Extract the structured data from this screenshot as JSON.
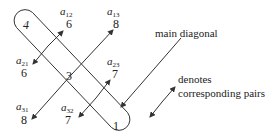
{
  "diagram": {
    "diagonal": [
      {
        "value": "4",
        "italic": true
      },
      {
        "value": "3",
        "italic": false
      },
      {
        "value": "1",
        "italic": false
      }
    ],
    "entries": {
      "a12": {
        "symbol": "a",
        "sub": "12",
        "value": "6"
      },
      "a13": {
        "symbol": "a",
        "sub": "13",
        "value": "8"
      },
      "a21": {
        "symbol": "a",
        "sub": "21",
        "value": "6"
      },
      "a23": {
        "symbol": "a",
        "sub": "23",
        "value": "7"
      },
      "a31": {
        "symbol": "a",
        "sub": "31",
        "value": "8"
      },
      "a32": {
        "symbol": "a",
        "sub": "32",
        "value": "7"
      }
    },
    "pairs": [
      [
        "a12",
        "a21"
      ],
      [
        "a13",
        "a31"
      ],
      [
        "a23",
        "a32"
      ]
    ],
    "annotations": {
      "main_diagonal": "main diagonal",
      "legend_line1": "denotes",
      "legend_line2": "corresponding pairs"
    },
    "colors": {
      "stroke": "#333333",
      "text": "#222222"
    }
  }
}
